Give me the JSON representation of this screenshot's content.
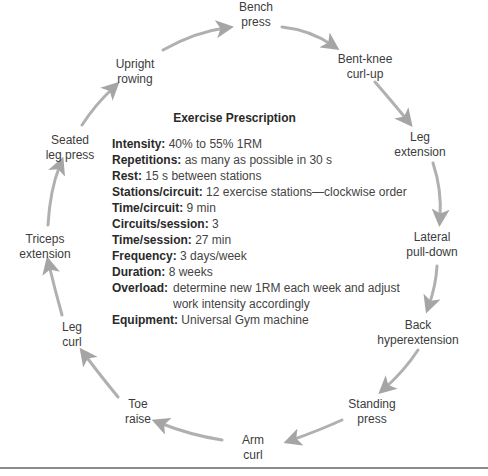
{
  "prescription": {
    "title": "Exercise Prescription",
    "rows": [
      {
        "label": "Intensity:",
        "value": "40% to 55% 1RM"
      },
      {
        "label": "Repetitions:",
        "value": "as many as possible in 30 s"
      },
      {
        "label": "Rest:",
        "value": "15 s between stations"
      },
      {
        "label": "Stations/circuit:",
        "value": "12 exercise stations—clockwise order"
      },
      {
        "label": "Time/circuit:",
        "value": "9 min"
      },
      {
        "label": "Circuits/session:",
        "value": "3"
      },
      {
        "label": "Time/session:",
        "value": "27 min"
      },
      {
        "label": "Frequency:",
        "value": "3 days/week"
      },
      {
        "label": "Duration:",
        "value": "8 weeks"
      },
      {
        "label": "Overload:",
        "value": "determine new 1RM each week and adjust work intensity accordingly"
      },
      {
        "label": "Equipment:",
        "value": "Universal Gym machine"
      }
    ]
  },
  "stations": [
    {
      "line1": "Bench",
      "line2": "press"
    },
    {
      "line1": "Bent-knee",
      "line2": "curl-up"
    },
    {
      "line1": "Leg",
      "line2": "extension"
    },
    {
      "line1": "Lateral",
      "line2": "pull-down"
    },
    {
      "line1": "Back",
      "line2": "hyperextension"
    },
    {
      "line1": "Standing",
      "line2": "press"
    },
    {
      "line1": "Arm",
      "line2": "curl"
    },
    {
      "line1": "Toe",
      "line2": "raise"
    },
    {
      "line1": "Leg",
      "line2": "curl"
    },
    {
      "line1": "Triceps",
      "line2": "extension"
    },
    {
      "line1": "Seated",
      "line2": "leg press"
    },
    {
      "line1": "Upright",
      "line2": "rowing"
    }
  ],
  "colors": {
    "arrow": "#a8a8a8",
    "text": "#3c3c3c",
    "divider": "#8a8a8a"
  }
}
